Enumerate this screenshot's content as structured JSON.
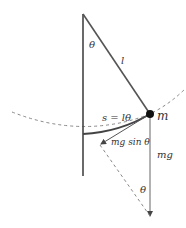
{
  "diagram": {
    "type": "simple pendulum force diagram",
    "labels": {
      "angle_top": "θ",
      "length": "l",
      "arc": "s = lθ",
      "mass": "m",
      "tangential_force": "mg sin θ",
      "weight": "mg",
      "angle_bottom": "θ"
    },
    "colors": {
      "line": "#444444",
      "dashed": "#888888",
      "bob": "#111111"
    }
  }
}
